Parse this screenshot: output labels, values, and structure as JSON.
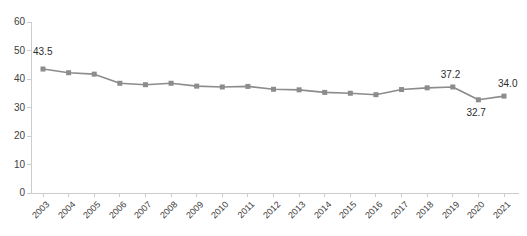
{
  "chart_data": {
    "type": "line",
    "title": "",
    "subtitle": "",
    "xlabel": "",
    "ylabel": "",
    "ylim": [
      0,
      60
    ],
    "ytick_values": [
      0,
      10,
      20,
      30,
      40,
      50,
      60
    ],
    "ytick_labels": [
      "0",
      "10",
      "20",
      "30",
      "40",
      "50",
      "60"
    ],
    "grid": false,
    "legend": false,
    "legend_position": "none",
    "categories": [
      "2003",
      "2004",
      "2005",
      "2006",
      "2007",
      "2008",
      "2009",
      "2010",
      "2011",
      "2012",
      "2013",
      "2014",
      "2015",
      "2016",
      "2017",
      "2018",
      "2019",
      "2020",
      "2021"
    ],
    "values": [
      43.5,
      42.2,
      41.7,
      38.5,
      38.0,
      38.5,
      37.5,
      37.2,
      37.4,
      36.4,
      36.2,
      35.3,
      35.0,
      34.5,
      36.3,
      36.9,
      37.2,
      32.7,
      34.0
    ],
    "point_labels": [
      {
        "category": "2003",
        "value": 43.5,
        "text": "43.5",
        "position": "above-left"
      },
      {
        "category": "2019",
        "value": 37.2,
        "text": "37.2",
        "position": "above"
      },
      {
        "category": "2020",
        "value": 32.7,
        "text": "32.7",
        "position": "below"
      },
      {
        "category": "2021",
        "value": 34.0,
        "text": "34.0",
        "position": "above-right"
      }
    ],
    "series_color": "#8c8c8c",
    "marker": "square",
    "marker_color": "#8c8c8c",
    "axis_color": "#cccccc",
    "tick_label_color": "#404040"
  }
}
